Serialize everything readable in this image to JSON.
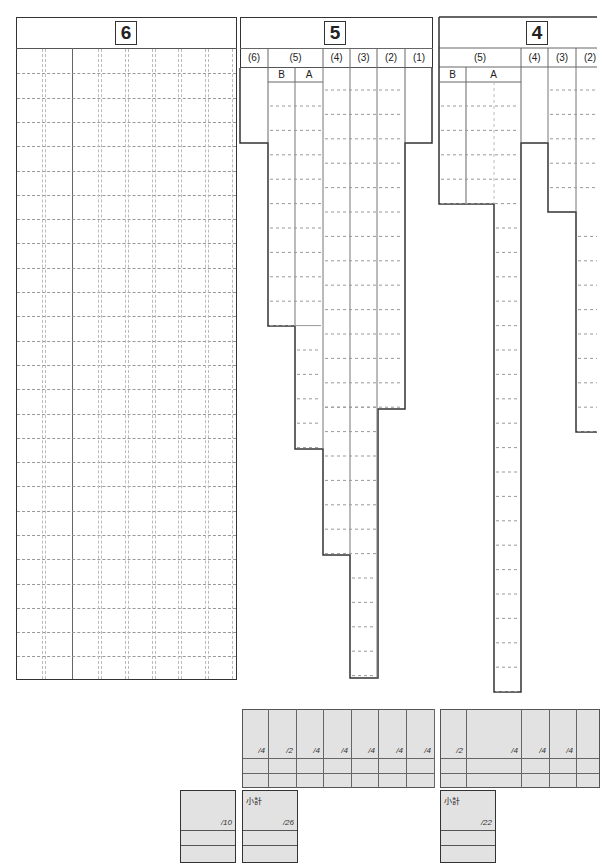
{
  "sections": [
    {
      "id": "6",
      "title": "6",
      "columns": [],
      "answer_rows": 26
    },
    {
      "id": "5",
      "title": "5",
      "columns": [
        "(6)",
        "(5)",
        "(4)",
        "(3)",
        "(2)",
        "(1)"
      ],
      "sub_columns": [
        "B",
        "A"
      ]
    },
    {
      "id": "4",
      "title": "4",
      "columns": [
        "(5)",
        "(4)",
        "(3)",
        "(2)"
      ],
      "sub_columns": [
        "B",
        "A"
      ]
    }
  ],
  "scores": {
    "section5": [
      "/4",
      "/2",
      "/4",
      "/4",
      "/4",
      "/4",
      "/4"
    ],
    "section4": [
      "/2",
      "/4",
      "/4",
      "/4"
    ],
    "section6_total": "/10",
    "section5_subtotal_label": "小計",
    "section5_subtotal": "/26",
    "section4_subtotal_label": "小計",
    "section4_subtotal": "/22"
  }
}
